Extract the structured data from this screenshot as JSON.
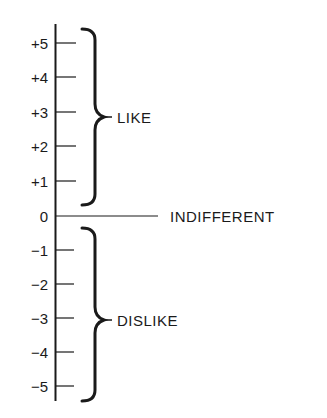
{
  "diagram": {
    "scale": {
      "ticks": [
        {
          "label": "+5",
          "value": 5
        },
        {
          "label": "+4",
          "value": 4
        },
        {
          "label": "+3",
          "value": 3
        },
        {
          "label": "+2",
          "value": 2
        },
        {
          "label": "+1",
          "value": 1
        },
        {
          "label": "0",
          "value": 0
        },
        {
          "label": "−1",
          "value": -1
        },
        {
          "label": "−2",
          "value": -2
        },
        {
          "label": "−3",
          "value": -3
        },
        {
          "label": "−4",
          "value": -4
        },
        {
          "label": "−5",
          "value": -5
        }
      ]
    },
    "labels": {
      "like": "LIKE",
      "indifferent": "INDIFFERENT",
      "dislike": "DISLIKE"
    },
    "colors": {
      "ink": "#1a1a1a",
      "background": "#ffffff"
    }
  }
}
